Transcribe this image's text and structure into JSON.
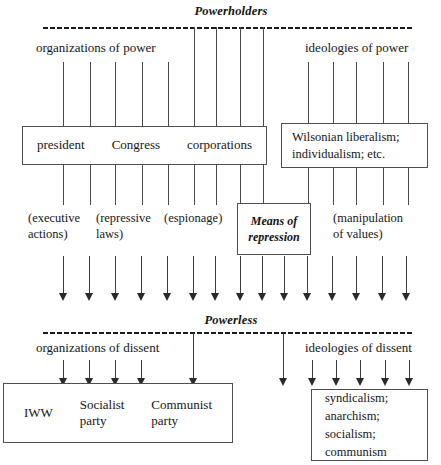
{
  "diagram": {
    "title_top": "Powerholders",
    "title_bottom": "Powerless",
    "top_left_caption": "organizations of power",
    "top_right_caption": "ideologies of power",
    "bottom_left_caption": "organizations of dissent",
    "bottom_right_caption": "ideologies of dissent",
    "ink_color": "#1a1a1a",
    "rule_color": "#4a4a4a",
    "box_border_color": "#4f4f4f",
    "background_color": "#ffffff"
  },
  "power_box": {
    "items": [
      "president",
      "Congress",
      "corporations"
    ]
  },
  "ideology_box": {
    "lines": [
      "Wilsonian liberalism;",
      "individualism; etc."
    ]
  },
  "means_box": {
    "lines": [
      "Means of",
      "repression"
    ]
  },
  "mechanism_labels": [
    {
      "lines": [
        "(executive",
        "actions)"
      ]
    },
    {
      "lines": [
        "(repressive",
        "laws)"
      ]
    },
    {
      "lines": [
        "(espionage)"
      ]
    },
    {
      "lines": [
        "(manipulation",
        "of values)"
      ]
    }
  ],
  "dissent_box": {
    "items": [
      {
        "lines": [
          "IWW"
        ]
      },
      {
        "lines": [
          "Socialist",
          "party"
        ]
      },
      {
        "lines": [
          "Communist",
          "party"
        ]
      }
    ]
  },
  "dissent_ideology_box": {
    "lines": [
      "syndicalism;",
      "anarchism;",
      "socialism;",
      "communism"
    ]
  }
}
